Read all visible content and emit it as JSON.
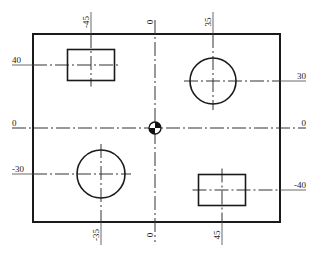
{
  "drawing": {
    "frame": {
      "x": 33,
      "y": 34,
      "w": 247,
      "h": 188
    },
    "origin": {
      "x": 155,
      "y": 128,
      "symbol": "datum-origin-icon"
    },
    "colors": {
      "line": "#1a1a1a",
      "text": "#222222",
      "background": "#ffffff"
    },
    "features": [
      {
        "type": "rectangle",
        "cx": 91,
        "cy": 65,
        "w": 47,
        "h": 31,
        "coord_x": "-45",
        "coord_y": "40"
      },
      {
        "type": "circle",
        "cx": 213,
        "cy": 81,
        "r": 23,
        "coord_x": "35",
        "coord_y": "30"
      },
      {
        "type": "circle",
        "cx": 101,
        "cy": 174,
        "r": 24,
        "coord_x": "-35",
        "coord_y": "-30"
      },
      {
        "type": "rectangle",
        "cx": 222,
        "cy": 190,
        "w": 47,
        "h": 31,
        "coord_x": "45",
        "coord_y": "-40"
      }
    ],
    "top_labels": [
      {
        "text": "-45",
        "x": 91
      },
      {
        "text": "0",
        "x": 155
      },
      {
        "text": "35",
        "x": 213
      }
    ],
    "bottom_labels": [
      {
        "text": "-35",
        "x": 101
      },
      {
        "text": "0",
        "x": 155
      },
      {
        "text": "45",
        "x": 222
      }
    ],
    "left_labels": [
      {
        "text": "40",
        "y": 65
      },
      {
        "text": "0",
        "y": 128
      },
      {
        "text": "-30",
        "y": 174
      }
    ],
    "right_labels": [
      {
        "text": "30",
        "y": 81
      },
      {
        "text": "0",
        "y": 128
      },
      {
        "text": "-40",
        "y": 190
      }
    ]
  }
}
